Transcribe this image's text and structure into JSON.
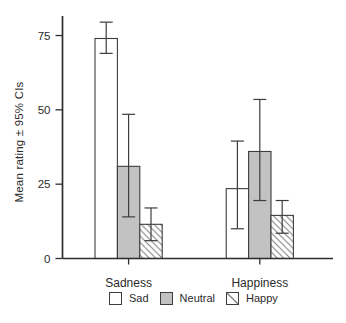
{
  "figure": {
    "background": "#ffffff"
  },
  "colors": {
    "axis": "#2e2e2e",
    "text": "#2b2b2b",
    "bar_stroke": "#3d3d3d",
    "open_fill": "#ffffff",
    "neutral_fill": "#c2c2c2",
    "hatch_line": "#7a7a7a",
    "error_bar": "#3d3d3d"
  },
  "chart_data": {
    "type": "bar",
    "title": "",
    "xlabel": "",
    "ylabel": "Mean rating ± 95% CIs",
    "categories": [
      "Sadness",
      "Happiness"
    ],
    "series": [
      {
        "name": "Sad",
        "style": "open",
        "values": [
          74,
          23.5
        ],
        "ci_low": [
          69,
          10
        ],
        "ci_high": [
          79.5,
          39.5
        ]
      },
      {
        "name": "Neutral",
        "style": "gray",
        "values": [
          31,
          36
        ],
        "ci_low": [
          14,
          19.5
        ],
        "ci_high": [
          48.5,
          53.5
        ]
      },
      {
        "name": "Happy",
        "style": "hatched",
        "values": [
          11.5,
          14.5
        ],
        "ci_low": [
          6,
          8.5
        ],
        "ci_high": [
          17,
          19.5
        ]
      }
    ],
    "yticks": [
      0,
      25,
      50,
      75
    ],
    "ylim": [
      0,
      81
    ],
    "error_bars": "95% CI",
    "legend_position": "bottom",
    "grid": false
  }
}
